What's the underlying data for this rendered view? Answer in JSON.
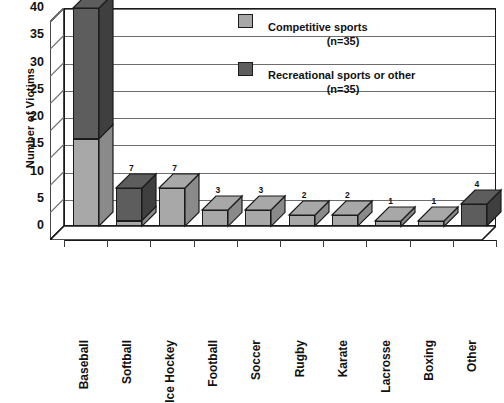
{
  "chart_data": {
    "type": "bar",
    "title": "",
    "subtitle": "",
    "xlabel": "",
    "ylabel": "Number of Victims",
    "ylim": [
      0,
      40
    ],
    "yticks": [
      0,
      5,
      10,
      15,
      20,
      25,
      30,
      35,
      40
    ],
    "ytick_labels": [
      "0",
      "5",
      "10",
      "15",
      "20",
      "25",
      "30",
      "35",
      "40"
    ],
    "grid": "horizontal",
    "stacked": true,
    "three_d": true,
    "legend_position": "upper-right-inside",
    "categories": [
      "Baseball",
      "Softball",
      "Ice Hockey",
      "Football",
      "Soccer",
      "Rugby",
      "Karate",
      "Lacrosse",
      "Boxing",
      "Other"
    ],
    "totals": [
      40,
      7,
      7,
      3,
      3,
      2,
      2,
      1,
      1,
      4
    ],
    "data_labels": [
      "40",
      "7",
      "7",
      "3",
      "3",
      "2",
      "2",
      "1",
      "1",
      "4"
    ],
    "series": [
      {
        "name": "Competitive sports",
        "sublabel": "(n=35)",
        "color": "#a8a8a8",
        "values": [
          16,
          1,
          7,
          3,
          3,
          2,
          2,
          1,
          1,
          0
        ]
      },
      {
        "name": "Recreational sports or other",
        "sublabel": "(n=35)",
        "color": "#5d5d5d",
        "values": [
          24,
          6,
          0,
          0,
          0,
          0,
          0,
          0,
          0,
          4
        ]
      }
    ]
  },
  "axis": {
    "y_title": "Number of Victims",
    "y_tick_labels": [
      "40",
      "35",
      "30",
      "25",
      "20",
      "15",
      "10",
      "5",
      "0"
    ],
    "x_tick_labels": [
      "Baseball",
      "Softball",
      "Ice Hockey",
      "Football",
      "Soccer",
      "Rugby",
      "Karate",
      "Lacrosse",
      "Boxing",
      "Other"
    ]
  },
  "legend": {
    "items": [
      {
        "label": "Competitive sports",
        "sublabel": "(n=35)",
        "swatch": "light"
      },
      {
        "label": "Recreational sports or other",
        "sublabel": "(n=35)",
        "swatch": "dark"
      }
    ]
  },
  "bar_labels": [
    "40",
    "7",
    "7",
    "3",
    "3",
    "2",
    "2",
    "1",
    "1",
    "4"
  ],
  "colors": {
    "competitive": "#a8a8a8",
    "recreational": "#5d5d5d",
    "outline": "#1b1b1b",
    "gridline": "#6d6d6d",
    "background": "#ffffff"
  }
}
